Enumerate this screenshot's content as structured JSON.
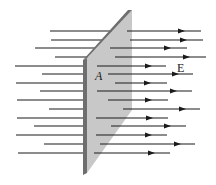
{
  "diagram": {
    "labels": {
      "area": "A",
      "field": "E"
    },
    "colors": {
      "line": "#1a1a1a",
      "plate_face": "#c8c8c8",
      "plate_edge": "#6e6e6e",
      "background": "#ffffff"
    },
    "plate": {
      "face": [
        [
          87,
          58
        ],
        [
          132,
          10
        ],
        [
          132,
          110
        ],
        [
          87,
          173
        ]
      ],
      "edge": [
        [
          83,
          60
        ],
        [
          87,
          58
        ],
        [
          87,
          173
        ],
        [
          83,
          175
        ]
      ],
      "top_bevel": [
        [
          83,
          60
        ],
        [
          128,
          10
        ],
        [
          132,
          10
        ],
        [
          87,
          58
        ]
      ]
    },
    "field_lines": [
      {
        "y": 31,
        "left": [
          50,
          112
        ],
        "right": [
          127,
          201
        ],
        "arrow": 183
      },
      {
        "y": 40,
        "left": [
          51,
          103
        ],
        "right": [
          130,
          203
        ],
        "arrow": 185
      },
      {
        "y": 48,
        "left": [
          35,
          95
        ],
        "right": [
          110,
          187
        ],
        "arrow": 169
      },
      {
        "y": 57,
        "left": [
          55,
          88
        ],
        "right": [
          115,
          206
        ],
        "arrow": 188
      },
      {
        "y": 66,
        "left": [
          15,
          83
        ],
        "right": [
          97,
          166
        ],
        "arrow": 150
      },
      {
        "y": 74,
        "left": [
          42,
          83
        ],
        "right": [
          108,
          193
        ],
        "arrow": 177
      },
      {
        "y": 83,
        "left": [
          16,
          83
        ],
        "right": [
          115,
          167
        ],
        "arrow": 149
      },
      {
        "y": 91,
        "left": [
          40,
          83
        ],
        "right": [
          97,
          192
        ],
        "arrow": 175
      },
      {
        "y": 100,
        "left": [
          17,
          83
        ],
        "right": [
          108,
          168
        ],
        "arrow": 150
      },
      {
        "y": 109,
        "left": [
          49,
          83
        ],
        "right": [
          123,
          200
        ],
        "arrow": 184
      },
      {
        "y": 118,
        "left": [
          17,
          83
        ],
        "right": [
          96,
          168
        ],
        "arrow": 151
      },
      {
        "y": 126,
        "left": [
          34,
          83
        ],
        "right": [
          111,
          186
        ],
        "arrow": 169
      },
      {
        "y": 135,
        "left": [
          16,
          83
        ],
        "right": [
          96,
          167
        ],
        "arrow": 150
      },
      {
        "y": 144,
        "left": [
          44,
          83
        ],
        "right": [
          100,
          195
        ],
        "arrow": 179
      },
      {
        "y": 153,
        "left": [
          18,
          83
        ],
        "right": [
          94,
          170
        ],
        "arrow": 153
      }
    ]
  }
}
